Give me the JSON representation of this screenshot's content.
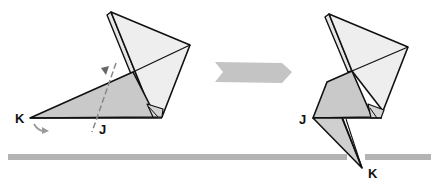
{
  "diagram": {
    "type": "origami-fold-step",
    "colors": {
      "paper_light": "#eeeeee",
      "paper_shaded": "#c9c9c9",
      "paper_mid": "#dcdcdc",
      "edge": "#111111",
      "arrow": "#bdbdbd",
      "baseline": "#b3b3b3",
      "fold_guide": "#888888"
    },
    "before": {
      "labels": {
        "point_k": "K",
        "point_j": "J"
      },
      "fold_line": "valley-fold-dashed",
      "fold_indicator": "triangle-arrow",
      "motion_arrow": "curved-arrow"
    },
    "transition_arrow": "step-arrow-right",
    "after": {
      "labels": {
        "point_j": "J",
        "point_k": "K"
      }
    },
    "baseline": "reference-line"
  }
}
